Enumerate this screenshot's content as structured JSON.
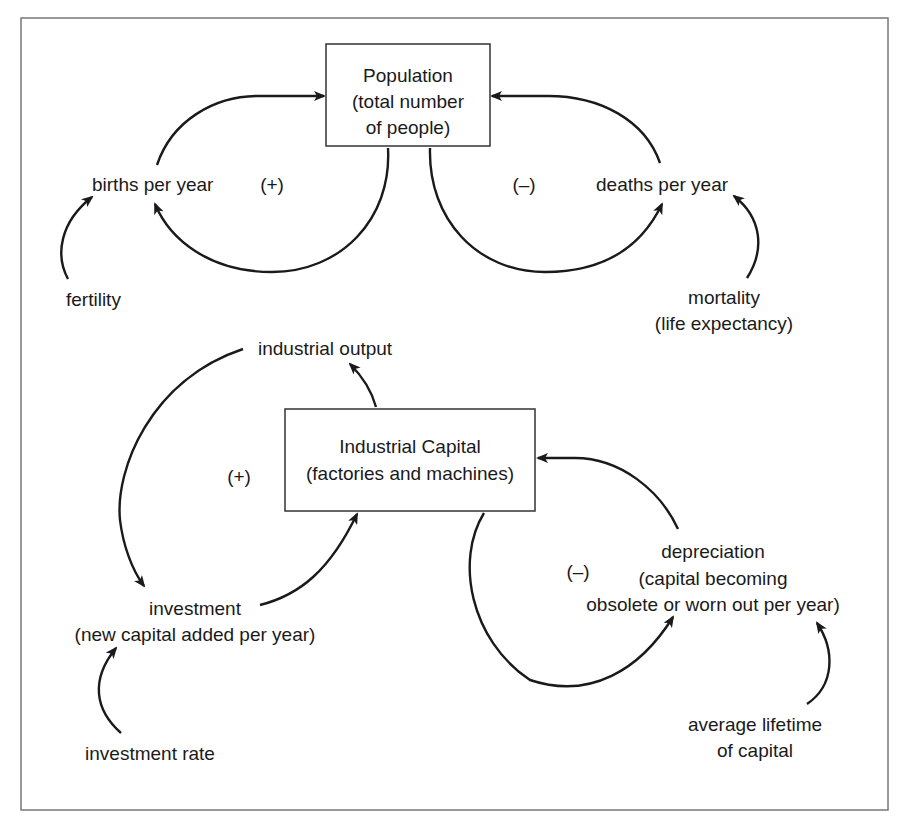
{
  "diagram": {
    "type": "causal-loop",
    "stocks": [
      {
        "id": "population",
        "lines": [
          "Population",
          "(total number",
          "of people)"
        ]
      },
      {
        "id": "industrial_capital",
        "lines": [
          "Industrial Capital",
          "(factories and machines)"
        ]
      }
    ],
    "nodes": {
      "births": {
        "lines": [
          "births per year"
        ]
      },
      "deaths": {
        "lines": [
          "deaths per year"
        ]
      },
      "fertility": {
        "lines": [
          "fertility"
        ]
      },
      "mortality": {
        "lines": [
          "mortality",
          "(life expectancy)"
        ]
      },
      "industrial_output": {
        "lines": [
          "industrial output"
        ]
      },
      "investment": {
        "lines": [
          "investment",
          "(new capital added per year)"
        ]
      },
      "investment_rate": {
        "lines": [
          "investment rate"
        ]
      },
      "depreciation": {
        "lines": [
          "depreciation",
          "(capital becoming",
          "obsolete or worn out per year)"
        ]
      },
      "average_lifetime": {
        "lines": [
          "average lifetime",
          "of capital"
        ]
      }
    },
    "loop_polarities": {
      "population_births": "(+)",
      "population_deaths": "(–)",
      "capital_investment": "(+)",
      "capital_depreciation": "(–)"
    },
    "edges": [
      {
        "from": "births per year",
        "to": "Population"
      },
      {
        "from": "Population",
        "to": "births per year"
      },
      {
        "from": "fertility",
        "to": "births per year"
      },
      {
        "from": "deaths per year",
        "to": "Population"
      },
      {
        "from": "Population",
        "to": "deaths per year"
      },
      {
        "from": "mortality",
        "to": "deaths per year"
      },
      {
        "from": "Industrial Capital",
        "to": "industrial output"
      },
      {
        "from": "industrial output",
        "to": "investment"
      },
      {
        "from": "investment",
        "to": "Industrial Capital"
      },
      {
        "from": "investment rate",
        "to": "investment"
      },
      {
        "from": "depreciation",
        "to": "Industrial Capital"
      },
      {
        "from": "Industrial Capital",
        "to": "depreciation"
      },
      {
        "from": "average lifetime of capital",
        "to": "depreciation"
      }
    ]
  }
}
